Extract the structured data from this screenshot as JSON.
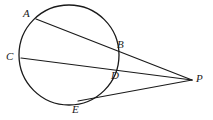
{
  "figure": {
    "type": "circle-secants-geometry-diagram",
    "background_color": "#ffffff",
    "stroke_color": "#1a1a1a",
    "label_color": "#1a1a1a",
    "width": 213,
    "height": 120
  },
  "circle": {
    "name": "circle",
    "center_x": 69,
    "center_y": 55,
    "radius": 50,
    "stroke_width": 1.3
  },
  "points": {
    "A": {
      "label": "A",
      "x": 36,
      "y": 19,
      "label_x": 23,
      "label_y": 8
    },
    "B": {
      "label": "B",
      "x": 113,
      "y": 47,
      "label_x": 117,
      "label_y": 39
    },
    "C": {
      "label": "C",
      "x": 21,
      "y": 58,
      "label_x": 6,
      "label_y": 51
    },
    "D": {
      "label": "D",
      "x": 107,
      "y": 72,
      "label_x": 111,
      "label_y": 70
    },
    "E": {
      "label": "E",
      "x": 78,
      "y": 101,
      "label_x": 72,
      "label_y": 104
    },
    "P": {
      "label": "P",
      "x": 192,
      "y": 80,
      "label_x": 196,
      "label_y": 73
    }
  },
  "segments": [
    {
      "name": "secant-A-B-P",
      "from": "A",
      "to": "P",
      "x1": 36,
      "y1": 19,
      "x2": 192,
      "y2": 80
    },
    {
      "name": "secant-C-D-P",
      "from": "C",
      "to": "P",
      "x1": 21,
      "y1": 58,
      "x2": 192,
      "y2": 80
    },
    {
      "name": "secant-E-P",
      "from": "E",
      "to": "P",
      "x1": 78,
      "y1": 101,
      "x2": 192,
      "y2": 80
    }
  ]
}
